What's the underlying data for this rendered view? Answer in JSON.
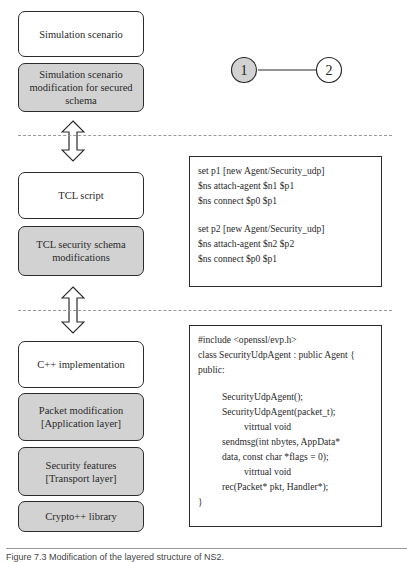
{
  "left_column": {
    "section1": {
      "box_scenario": "Simulation scenario",
      "box_scenario_mod": "Simulation scenario modification for secured schema"
    },
    "section2": {
      "box_tcl": "TCL script",
      "box_tcl_mod": "TCL security schema modifications"
    },
    "section3": {
      "box_cpp": "C++ implementation",
      "box_packet_line1": "Packet modification",
      "box_packet_line2": "[Application layer]",
      "box_security_line1": "Security features",
      "box_security_line2": "[Transport layer]",
      "box_crypto": "Crypto++ library"
    }
  },
  "topology": {
    "node1": "1",
    "node2": "2",
    "node1_fill": "#d2d2d2",
    "node2_fill": "#ffffff"
  },
  "tcl_code": {
    "lines": [
      "set p1 [new Agent/Security_udp]",
      "$ns attach-agent $n1 $p1",
      "$ns connect $p0 $p1",
      "",
      "set p2 [new Agent/Security_udp]",
      "$ns attach-agent $n2 $p2",
      "$ns connect $p0 $p1"
    ]
  },
  "cpp_code": {
    "l0": "#include <openssl/evp.h>",
    "l1": "class SecurityUdpAgent : public Agent {",
    "l2": "public:",
    "l3": "",
    "l4": "SecurityUdpAgent();",
    "l5": "SecurityUdpAgent(packet_t);",
    "l6": "vitrtual void",
    "l7": "sendmsg(int nbytes, AppData*",
    "l8": "data, const char *flags = 0);",
    "l9": "vitrtual void",
    "l10": "rec(Packet* pkt, Handler*);",
    "l11": "}"
  },
  "caption": "Figure 7.3  Modification of the layered structure of NS2."
}
